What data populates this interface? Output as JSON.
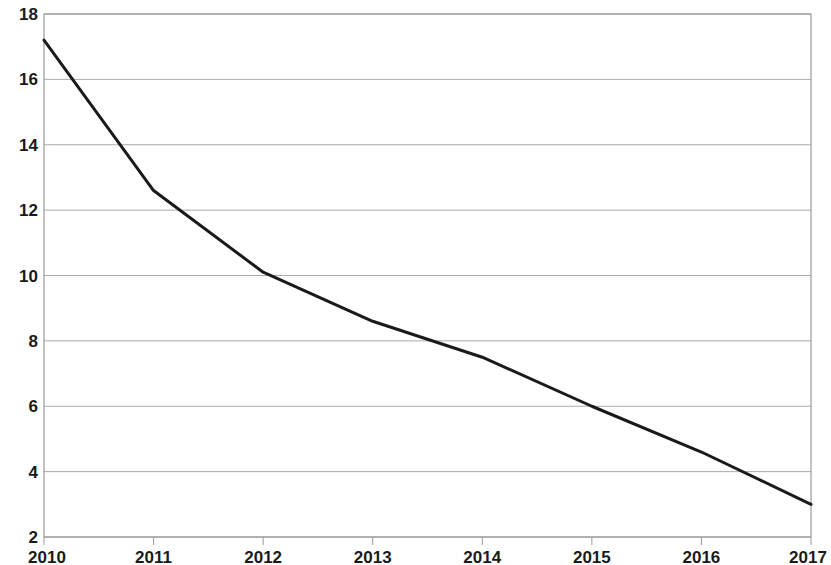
{
  "chart_data": {
    "type": "line",
    "title": "",
    "subtitle": "",
    "xlabel": "",
    "ylabel": "",
    "categories": [
      "2010",
      "2011",
      "2012",
      "2013",
      "2014",
      "2015",
      "2016",
      "2017"
    ],
    "x": [
      2010,
      2011,
      2012,
      2013,
      2014,
      2015,
      2016,
      2017
    ],
    "values": [
      17.2,
      12.6,
      10.1,
      8.6,
      7.5,
      6.0,
      4.6,
      3.0
    ],
    "series": [
      {
        "name": "",
        "values": [
          17.2,
          12.6,
          10.1,
          8.6,
          7.5,
          6.0,
          4.6,
          3.0
        ]
      }
    ],
    "xlim": [
      2010,
      2017
    ],
    "ylim": [
      2,
      18
    ],
    "x_ticks": [
      "2010",
      "2011",
      "2012",
      "2013",
      "2014",
      "2015",
      "2016",
      "2017"
    ],
    "y_ticks": [
      "18",
      "16",
      "14",
      "12",
      "10",
      "8",
      "6",
      "4",
      "2"
    ],
    "y_tick_values": [
      18,
      16,
      14,
      12,
      10,
      8,
      6,
      4,
      2
    ],
    "grid": "horizontal",
    "legend": "none",
    "legend_position": "none",
    "annotations": [],
    "line_color": "#1a1a1a",
    "grid_color": "#aaaaaa",
    "axis_color": "#999999",
    "background_color": "#ffffff",
    "line_width": 3
  }
}
